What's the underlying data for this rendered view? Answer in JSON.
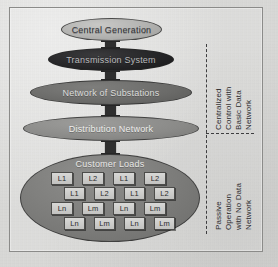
{
  "figure": {
    "background_color": "#dcdcda",
    "frame_color": "#8b8b89"
  },
  "nodes": [
    {
      "id": "generation",
      "label": "Central Generation",
      "fill": "#b2b2b0",
      "text_color": "#35353a"
    },
    {
      "id": "transmission",
      "label": "Transmission System",
      "fill": "#242426",
      "text_color": "#b9b9bb"
    },
    {
      "id": "substations",
      "label": "Network of Substations",
      "fill": "#6a6a68",
      "text_color": "#dcdcda"
    },
    {
      "id": "distribution",
      "label": "Distribution Network",
      "fill": "#8a8a88",
      "text_color": "#eeeeec"
    },
    {
      "id": "customer",
      "label": "Customer Loads",
      "fill": "#7c7c7a",
      "text_color": "#e8e8e6"
    }
  ],
  "load_grid": {
    "rows": [
      {
        "offset": false,
        "cells": [
          "L1",
          "L2",
          "L1",
          "L2"
        ]
      },
      {
        "offset": true,
        "cells": [
          "L1",
          "L2",
          "L1",
          "L2"
        ]
      },
      {
        "offset": false,
        "cells": [
          "Ln",
          "Lm",
          "Ln",
          "Lm"
        ]
      },
      {
        "offset": true,
        "cells": [
          "Ln",
          "Lm",
          "Ln",
          "Lm"
        ]
      }
    ]
  },
  "annotations": {
    "upper": "Centralized\nControl with\nBasic Data\nNetwork",
    "lower": "Passive\nOperation\nwith No Data\nNetwork"
  }
}
